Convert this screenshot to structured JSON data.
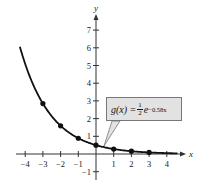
{
  "chart_data": {
    "type": "line",
    "title": "",
    "xlabel": "x",
    "ylabel": "y",
    "xlim": [
      -4.5,
      4.5
    ],
    "ylim": [
      -1.5,
      8
    ],
    "grid": false,
    "x_ticks": [
      -4,
      -3,
      -2,
      -1,
      1,
      2,
      3,
      4
    ],
    "y_ticks": [
      -1,
      1,
      2,
      3,
      4,
      5,
      6,
      7
    ],
    "series": [
      {
        "name": "g(x) = 1/2 e^(-0.58x)",
        "function": "0.5*exp(-0.58*x)",
        "points": [
          {
            "x": -3,
            "y": 2.85
          },
          {
            "x": -2,
            "y": 1.59
          },
          {
            "x": -1,
            "y": 0.89
          },
          {
            "x": 0,
            "y": 0.5
          },
          {
            "x": 1,
            "y": 0.28
          },
          {
            "x": 2,
            "y": 0.16
          },
          {
            "x": 3,
            "y": 0.09
          }
        ]
      }
    ],
    "annotations": [
      {
        "text": "g(x) = 1/2 e^(-0.58x)",
        "points_to": {
          "x": 0.5,
          "y": 0.37
        }
      }
    ]
  },
  "labels": {
    "x_axis": "x",
    "y_axis": "y",
    "x_ticks": [
      "−4",
      "−3",
      "−2",
      "−1",
      "1",
      "2",
      "3",
      "4"
    ],
    "y_ticks": [
      "−1",
      "1",
      "2",
      "3",
      "4",
      "5",
      "6",
      "7"
    ],
    "formula": {
      "lhs": "g(x) = ",
      "frac_num": "1",
      "frac_den": "2",
      "base": "e",
      "exponent": "−0.58x"
    }
  }
}
